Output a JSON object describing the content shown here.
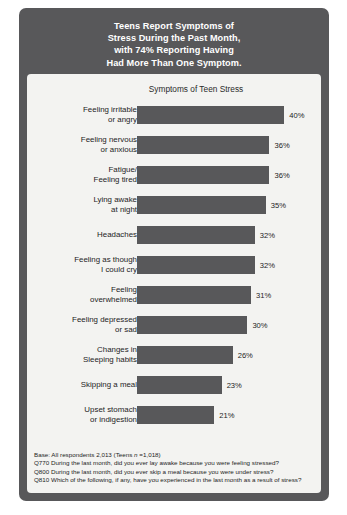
{
  "header": {
    "title_lines": [
      "Teens Report Symptoms of",
      "Stress During the Past Month,",
      "with 74% Reporting Having",
      "Had More Than One Symptom."
    ]
  },
  "chart_subtitle": "Symptoms of Teen Stress",
  "footnotes": {
    "base_prefix": "Base: All respondents 2,013 (Teens ",
    "base_italic": "n",
    "base_suffix": " =1,018)",
    "lines": [
      "Q770 During the last month, did you ever lay awake because you were feeling stressed?",
      "Q800 During the last month, did you ever skip a meal because you were under stress?",
      "Q810 Which of the following, if any, have you experienced in the last month as a result of stress?"
    ]
  },
  "colors": {
    "frame": "#58585a",
    "bar": "#58585a",
    "panel": "#f3f3f1",
    "title_text": "#ffffff",
    "body_text": "#1d1d1d"
  },
  "chart_data": {
    "type": "bar",
    "orientation": "horizontal",
    "title": "Symptoms of Teen Stress",
    "xlabel": "",
    "ylabel": "",
    "xlim": [
      0,
      50
    ],
    "grid": false,
    "legend": null,
    "value_suffix": "%",
    "categories": [
      "Feeling irritable or angry",
      "Feeling nervous or anxious",
      "Fatigue/ Feeling tired",
      "Lying awake at night",
      "Headaches",
      "Feeling as though I could cry",
      "Feeling overwhelmed",
      "Feeling depressed or sad",
      "Changes in Sleeping habits",
      "Skipping a meal",
      "Upset stomach or indigestion"
    ],
    "category_lines": [
      [
        "Feeling irritable",
        "or angry"
      ],
      [
        "Feeling nervous",
        "or anxious"
      ],
      [
        "Fatigue/",
        "Feeling tired"
      ],
      [
        "Lying awake",
        "at night"
      ],
      [
        "Headaches"
      ],
      [
        "Feeling as though",
        "I could cry"
      ],
      [
        "Feeling",
        "overwhelmed"
      ],
      [
        "Feeling depressed",
        "or sad"
      ],
      [
        "Changes in",
        "Sleeping habits"
      ],
      [
        "Skipping a meal"
      ],
      [
        "Upset stomach",
        "or indigestion"
      ]
    ],
    "values": [
      40,
      36,
      36,
      35,
      32,
      32,
      31,
      30,
      26,
      23,
      21
    ],
    "value_labels": [
      "40%",
      "36%",
      "36%",
      "35%",
      "32%",
      "32%",
      "31%",
      "30%",
      "26%",
      "23%",
      "21%"
    ]
  }
}
